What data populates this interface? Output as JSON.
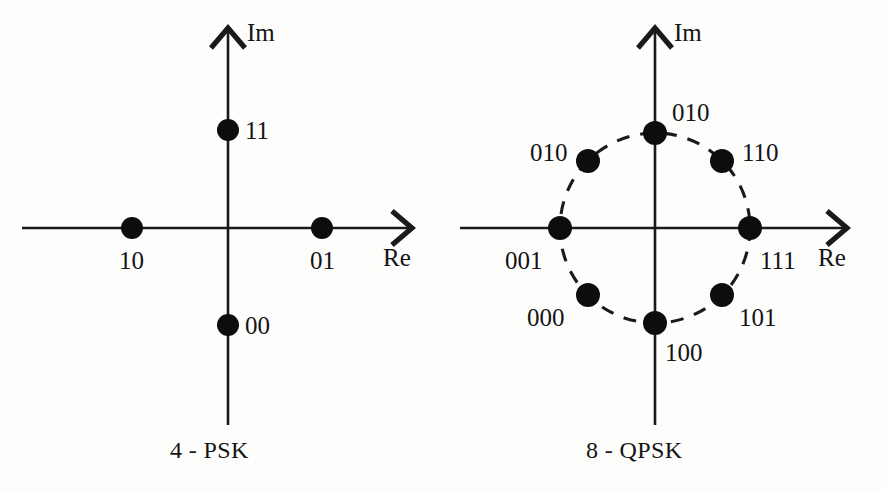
{
  "figure": {
    "background_color": "#fdfdfc",
    "ink_color": "#141414",
    "width": 886,
    "height": 491
  },
  "panels": [
    {
      "id": "4psk",
      "caption": "4 - PSK",
      "caption_x": 170,
      "caption_y": 438,
      "origin": {
        "x": 228,
        "y": 228
      },
      "axes": {
        "real": {
          "name": "Re",
          "label_x": 383,
          "label_y": 245,
          "x_start": 22,
          "x_end": 408,
          "arrow_tip_x": 412
        },
        "imag": {
          "name": "Im",
          "label_x": 247,
          "label_y": 20,
          "y_start": 425,
          "y_end": 32,
          "arrow_tip_y": 28
        }
      },
      "reference_circle": null,
      "points": [
        {
          "bits": "11",
          "cx": 228,
          "cy": 130,
          "r": 11,
          "label_x": 245,
          "label_y": 118,
          "angle_deg": 90
        },
        {
          "bits": "01",
          "cx": 322,
          "cy": 228,
          "r": 11,
          "label_x": 310,
          "label_y": 248,
          "angle_deg": 0
        },
        {
          "bits": "00",
          "cx": 228,
          "cy": 325,
          "r": 11,
          "label_x": 245,
          "label_y": 313,
          "angle_deg": 270
        },
        {
          "bits": "10",
          "cx": 132,
          "cy": 228,
          "r": 11,
          "label_x": 119,
          "label_y": 248,
          "angle_deg": 180
        }
      ]
    },
    {
      "id": "8qpsk",
      "caption": "8 - QPSK",
      "caption_x": 586,
      "caption_y": 438,
      "origin": {
        "x": 655,
        "y": 228
      },
      "axes": {
        "real": {
          "name": "Re",
          "label_x": 818,
          "label_y": 245,
          "x_start": 460,
          "x_end": 843,
          "arrow_tip_x": 847
        },
        "imag": {
          "name": "Im",
          "label_x": 674,
          "label_y": 20,
          "y_start": 425,
          "y_end": 32,
          "arrow_tip_y": 28
        }
      },
      "reference_circle": {
        "cx": 655,
        "cy": 228,
        "r": 95
      },
      "points": [
        {
          "bits": "010",
          "cx": 655,
          "cy": 133,
          "r": 12,
          "label_x": 672,
          "label_y": 100,
          "angle_deg": 90
        },
        {
          "bits": "110",
          "cx": 722,
          "cy": 161,
          "r": 12,
          "label_x": 742,
          "label_y": 140,
          "angle_deg": 45
        },
        {
          "bits": "111",
          "cx": 750,
          "cy": 228,
          "r": 12,
          "label_x": 760,
          "label_y": 248,
          "angle_deg": 0
        },
        {
          "bits": "101",
          "cx": 722,
          "cy": 295,
          "r": 12,
          "label_x": 739,
          "label_y": 305,
          "angle_deg": 315
        },
        {
          "bits": "100",
          "cx": 655,
          "cy": 323,
          "r": 12,
          "label_x": 665,
          "label_y": 340,
          "angle_deg": 270
        },
        {
          "bits": "000",
          "cx": 588,
          "cy": 295,
          "r": 12,
          "label_x": 527,
          "label_y": 305,
          "angle_deg": 225
        },
        {
          "bits": "001",
          "cx": 560,
          "cy": 228,
          "r": 12,
          "label_x": 505,
          "label_y": 248,
          "angle_deg": 180
        },
        {
          "bits": "010",
          "cx": 588,
          "cy": 161,
          "r": 12,
          "label_x": 530,
          "label_y": 140,
          "angle_deg": 135
        }
      ]
    }
  ],
  "chart_data": {
    "type": "scatter",
    "title": "",
    "subtitle": "",
    "xlabel": "Re",
    "ylabel": "Im",
    "grid": false,
    "legend_position": "none",
    "constellations": [
      {
        "name": "4 - PSK",
        "order": 4,
        "bits_per_symbol": 2,
        "unit_circle_shown": false,
        "axis_labels": {
          "x": "Re",
          "y": "Im"
        },
        "xlim": [
          -1.5,
          1.5
        ],
        "ylim": [
          -1.5,
          1.5
        ],
        "points": [
          {
            "label": "11",
            "re": 0,
            "im": 1,
            "angle_deg": 90
          },
          {
            "label": "01",
            "re": 1,
            "im": 0,
            "angle_deg": 0
          },
          {
            "label": "00",
            "re": 0,
            "im": -1,
            "angle_deg": 270
          },
          {
            "label": "10",
            "re": -1,
            "im": 0,
            "angle_deg": 180
          }
        ]
      },
      {
        "name": "8 - QPSK",
        "order": 8,
        "bits_per_symbol": 3,
        "unit_circle_shown": true,
        "unit_circle_style": "dashed",
        "axis_labels": {
          "x": "Re",
          "y": "Im"
        },
        "xlim": [
          -1.5,
          1.5
        ],
        "ylim": [
          -1.5,
          1.5
        ],
        "points": [
          {
            "label": "010",
            "re": 0.0,
            "im": 1.0,
            "angle_deg": 90
          },
          {
            "label": "110",
            "re": 0.707,
            "im": 0.707,
            "angle_deg": 45
          },
          {
            "label": "111",
            "re": 1.0,
            "im": 0.0,
            "angle_deg": 0
          },
          {
            "label": "101",
            "re": 0.707,
            "im": -0.707,
            "angle_deg": 315
          },
          {
            "label": "100",
            "re": 0.0,
            "im": -1.0,
            "angle_deg": 270
          },
          {
            "label": "000",
            "re": -0.707,
            "im": -0.707,
            "angle_deg": 225
          },
          {
            "label": "001",
            "re": -1.0,
            "im": 0.0,
            "angle_deg": 180
          },
          {
            "label": "010",
            "re": -0.707,
            "im": 0.707,
            "angle_deg": 135
          }
        ]
      }
    ]
  }
}
